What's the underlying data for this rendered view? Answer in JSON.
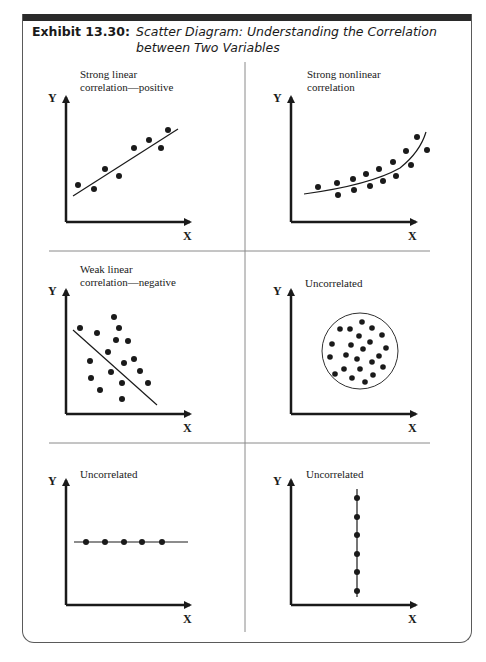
{
  "exhibit": {
    "number": "Exhibit 13.30:",
    "title": "Scatter Diagram: Understanding the Correlation between Two Variables"
  },
  "axes": {
    "x_label": "X",
    "y_label": "Y"
  },
  "panels": [
    {
      "id": "strong-linear-positive",
      "label_line1": "Strong linear",
      "label_line2": "correlation—positive"
    },
    {
      "id": "strong-nonlinear",
      "label_line1": "Strong nonlinear",
      "label_line2": "correlation"
    },
    {
      "id": "weak-linear-negative",
      "label_line1": "Weak linear",
      "label_line2": "correlation—negative"
    },
    {
      "id": "uncorrelated-cloud",
      "label_line1": "Uncorrelated",
      "label_line2": ""
    },
    {
      "id": "uncorrelated-horizontal",
      "label_line1": "Uncorrelated",
      "label_line2": ""
    },
    {
      "id": "uncorrelated-vertical",
      "label_line1": "Uncorrelated",
      "label_line2": ""
    }
  ],
  "colors": {
    "ink": "#1a1a1a",
    "frame": "#5a5a5a",
    "divider": "#8a8a8a",
    "bar": "#2a2a2a"
  }
}
